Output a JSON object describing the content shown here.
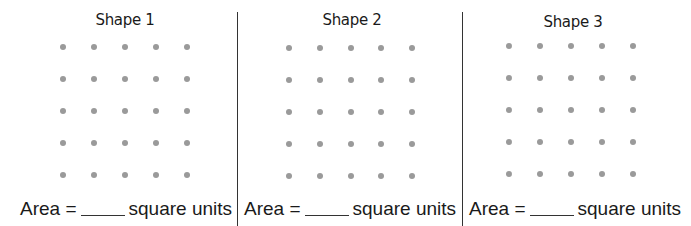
{
  "worksheet": {
    "panels": [
      {
        "title": "Shape 1",
        "title_pos": {
          "x": 125,
          "y": 11
        },
        "grid": {
          "cols": [
            63,
            94,
            125,
            156,
            187
          ],
          "rows": [
            47,
            79,
            111,
            143,
            175
          ]
        },
        "area_label": "Area =",
        "area_suffix": "square units",
        "area_x": 20,
        "answer": ""
      },
      {
        "title": "Shape 2",
        "title_pos": {
          "x": 352,
          "y": 11
        },
        "grid": {
          "cols": [
            289,
            320,
            351,
            381,
            412
          ],
          "rows": [
            48,
            80,
            112,
            144,
            176
          ]
        },
        "area_label": "Area =",
        "area_suffix": "square units",
        "area_x": 244,
        "answer": ""
      },
      {
        "title": "Shape 3",
        "title_pos": {
          "x": 573,
          "y": 13
        },
        "grid": {
          "cols": [
            509,
            540,
            571,
            602,
            633
          ],
          "rows": [
            46,
            78,
            110,
            142,
            174
          ]
        },
        "area_label": "Area =",
        "area_suffix": "square units",
        "area_x": 469,
        "answer": ""
      }
    ],
    "dividers_x": [
      237,
      462
    ],
    "colors": {
      "dot": "#9a9a9a",
      "divider": "#333333",
      "text": "#1a1a1a"
    }
  }
}
